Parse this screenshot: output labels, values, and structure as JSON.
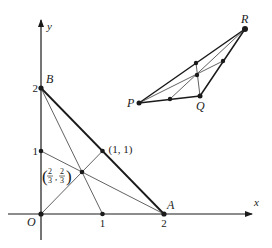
{
  "figure": {
    "width": 272,
    "height": 248,
    "colors": {
      "ink": "#1a1a1a",
      "thin": "#3a3a3a",
      "background": "#ffffff"
    }
  },
  "axes": {
    "origin_px": [
      41,
      214
    ],
    "unit_px": [
      61.5,
      63
    ],
    "x_axis": {
      "from_px": [
        8,
        214
      ],
      "to_px": [
        252,
        214
      ],
      "label": "x",
      "label_px": [
        254,
        206
      ]
    },
    "y_axis": {
      "from_px": [
        41,
        240
      ],
      "to_px": [
        41,
        20
      ],
      "label": "y",
      "label_px": [
        47,
        30
      ]
    },
    "origin_label": "O",
    "ticks": {
      "x": [
        {
          "value": 1,
          "label": "1"
        },
        {
          "value": 2,
          "label": "2"
        }
      ],
      "y": [
        {
          "value": 1,
          "label": "1"
        },
        {
          "value": 2,
          "label": "2"
        }
      ]
    }
  },
  "coordinate_triangle": {
    "vertices": [
      {
        "name": "O",
        "coords": [
          0,
          0
        ],
        "label": "O"
      },
      {
        "name": "A",
        "coords": [
          2,
          0
        ],
        "label": "A"
      },
      {
        "name": "B",
        "coords": [
          0,
          2
        ],
        "label": "B"
      }
    ],
    "midpoints": [
      {
        "name": "mid_OA",
        "coords": [
          1,
          0
        ]
      },
      {
        "name": "mid_OB",
        "coords": [
          0,
          1
        ]
      },
      {
        "name": "mid_AB",
        "coords": [
          1,
          1
        ],
        "label": "(1, 1)"
      }
    ],
    "centroid": {
      "coords": [
        0.6667,
        0.6667
      ],
      "label_num": "2",
      "label_den": "3",
      "label_text": "(2/3, 2/3)"
    },
    "medians": [
      {
        "from": "O",
        "to": "mid_AB"
      },
      {
        "from": "A",
        "to": "mid_OB"
      },
      {
        "from": "B",
        "to": "mid_OA"
      }
    ]
  },
  "general_triangle": {
    "vertices": [
      {
        "name": "P",
        "px": [
          139,
          103
        ],
        "label": "P"
      },
      {
        "name": "Q",
        "px": [
          200,
          96
        ],
        "label": "Q"
      },
      {
        "name": "R",
        "px": [
          245,
          29
        ],
        "label": "R"
      }
    ],
    "midpoints": [
      {
        "name": "mid_PQ",
        "px": [
          170,
          99
        ]
      },
      {
        "name": "mid_QR",
        "px": [
          223,
          61
        ]
      },
      {
        "name": "mid_PR",
        "px": [
          196,
          63
        ]
      }
    ],
    "centroid": {
      "px": [
        197,
        75
      ]
    }
  }
}
